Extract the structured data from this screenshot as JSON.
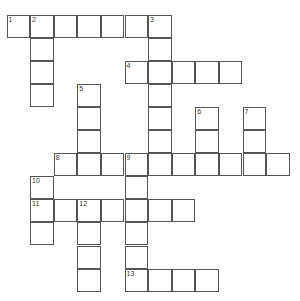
{
  "puzzle": {
    "type": "crossword",
    "origin": {
      "x": 7,
      "y": 15
    },
    "cell_size": {
      "w": 23.6,
      "h": 23.1
    },
    "rows": 12,
    "cols": 12,
    "cells": [
      {
        "r": 0,
        "c": 0,
        "n": "1"
      },
      {
        "r": 0,
        "c": 1,
        "n": "2"
      },
      {
        "r": 0,
        "c": 2
      },
      {
        "r": 0,
        "c": 3
      },
      {
        "r": 0,
        "c": 4
      },
      {
        "r": 0,
        "c": 5
      },
      {
        "r": 0,
        "c": 6,
        "n": "3"
      },
      {
        "r": 1,
        "c": 1
      },
      {
        "r": 1,
        "c": 6
      },
      {
        "r": 2,
        "c": 1
      },
      {
        "r": 2,
        "c": 5,
        "n": "4"
      },
      {
        "r": 2,
        "c": 6
      },
      {
        "r": 2,
        "c": 7
      },
      {
        "r": 2,
        "c": 8
      },
      {
        "r": 2,
        "c": 9
      },
      {
        "r": 3,
        "c": 1
      },
      {
        "r": 3,
        "c": 3,
        "n": "5"
      },
      {
        "r": 3,
        "c": 6
      },
      {
        "r": 4,
        "c": 3
      },
      {
        "r": 4,
        "c": 6
      },
      {
        "r": 4,
        "c": 8,
        "n": "6"
      },
      {
        "r": 4,
        "c": 10,
        "n": "7"
      },
      {
        "r": 5,
        "c": 3
      },
      {
        "r": 5,
        "c": 6
      },
      {
        "r": 5,
        "c": 8
      },
      {
        "r": 5,
        "c": 10
      },
      {
        "r": 6,
        "c": 2,
        "n": "8"
      },
      {
        "r": 6,
        "c": 3
      },
      {
        "r": 6,
        "c": 4
      },
      {
        "r": 6,
        "c": 5,
        "n": "9"
      },
      {
        "r": 6,
        "c": 6
      },
      {
        "r": 6,
        "c": 7
      },
      {
        "r": 6,
        "c": 8
      },
      {
        "r": 6,
        "c": 9
      },
      {
        "r": 6,
        "c": 10
      },
      {
        "r": 6,
        "c": 11
      },
      {
        "r": 7,
        "c": 1,
        "n": "10"
      },
      {
        "r": 7,
        "c": 5
      },
      {
        "r": 8,
        "c": 1,
        "n": "11"
      },
      {
        "r": 8,
        "c": 2
      },
      {
        "r": 8,
        "c": 3,
        "n": "12"
      },
      {
        "r": 8,
        "c": 4
      },
      {
        "r": 8,
        "c": 5
      },
      {
        "r": 8,
        "c": 6
      },
      {
        "r": 8,
        "c": 7
      },
      {
        "r": 9,
        "c": 1
      },
      {
        "r": 9,
        "c": 3
      },
      {
        "r": 9,
        "c": 5
      },
      {
        "r": 10,
        "c": 3
      },
      {
        "r": 10,
        "c": 5
      },
      {
        "r": 11,
        "c": 3
      },
      {
        "r": 11,
        "c": 5,
        "n": "13"
      },
      {
        "r": 11,
        "c": 6
      },
      {
        "r": 11,
        "c": 7
      },
      {
        "r": 11,
        "c": 8
      }
    ],
    "clue_numbers": [
      "1",
      "2",
      "3",
      "4",
      "5",
      "6",
      "7",
      "8",
      "9",
      "10",
      "11",
      "12",
      "13"
    ],
    "colors": {
      "border": "#555555",
      "cell": "#ffffff",
      "number": "#333333"
    }
  }
}
